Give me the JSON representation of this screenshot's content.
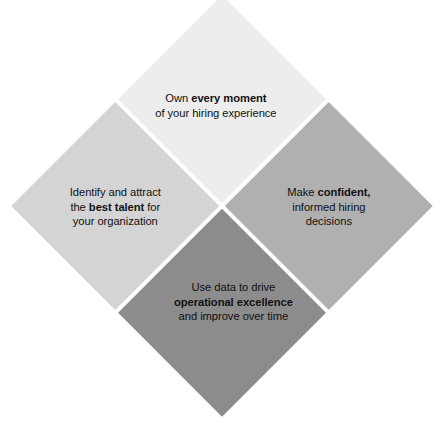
{
  "diagram": {
    "background_color": "#ffffff",
    "text_color": "#111111",
    "gap_color": "#ffffff",
    "quadrants": [
      {
        "position": "top",
        "color": "#ededed",
        "lines": [
          {
            "parts": [
              {
                "text": "Own ",
                "bold": false
              },
              {
                "text": "every moment",
                "bold": true
              }
            ]
          },
          {
            "parts": [
              {
                "text": "of your hiring experience",
                "bold": false
              }
            ]
          }
        ],
        "plain_text": "Own every moment of your hiring experience"
      },
      {
        "position": "left",
        "color": "#d4d4d4",
        "lines": [
          {
            "parts": [
              {
                "text": "Identify and attract",
                "bold": false
              }
            ]
          },
          {
            "parts": [
              {
                "text": "the ",
                "bold": false
              },
              {
                "text": "best talent",
                "bold": true
              },
              {
                "text": " for",
                "bold": false
              }
            ]
          },
          {
            "parts": [
              {
                "text": "your organization",
                "bold": false
              }
            ]
          }
        ],
        "plain_text": "Identify and attract the best talent for your organization"
      },
      {
        "position": "right",
        "color": "#b0b0b0",
        "lines": [
          {
            "parts": [
              {
                "text": "Make ",
                "bold": false
              },
              {
                "text": "confident,",
                "bold": true
              }
            ]
          },
          {
            "parts": [
              {
                "text": "informed hiring",
                "bold": false
              }
            ]
          },
          {
            "parts": [
              {
                "text": "decisions",
                "bold": false
              }
            ]
          }
        ],
        "plain_text": "Make confident, informed hiring decisions"
      },
      {
        "position": "bottom",
        "color": "#8c8c8c",
        "lines": [
          {
            "parts": [
              {
                "text": "Use data to drive",
                "bold": false
              }
            ]
          },
          {
            "parts": [
              {
                "text": "operational excellence",
                "bold": true
              }
            ]
          },
          {
            "parts": [
              {
                "text": "and improve over time",
                "bold": false
              }
            ]
          }
        ],
        "plain_text": "Use data to drive operational excellence and improve over time"
      }
    ]
  }
}
